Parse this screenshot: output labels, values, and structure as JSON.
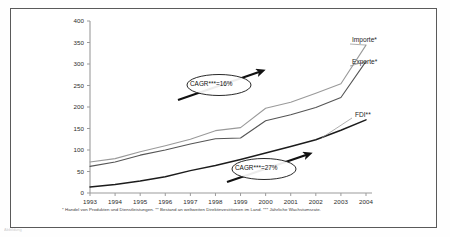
{
  "figure": {
    "frame_border_color": "#5a5a5a",
    "background": "#ffffff",
    "bottom_artifact_text": "Abbildung"
  },
  "footnote": "* Handel von Produkten und Dienstleistungen. ** Bestand an weltweiten Direktinvestitionen im Land. *** Jährliche Wachstumsrate.",
  "annotations": [
    {
      "id": "cagr-trade",
      "label": "CAGR***=16%"
    },
    {
      "id": "cagr-fdi",
      "label": "CAGR***=27%"
    }
  ],
  "series_labels": {
    "importe": "Importe*",
    "exporte": "Exporte*",
    "fdi": "FDI**"
  },
  "chart_data": {
    "type": "line",
    "title": "",
    "xlabel": "",
    "ylabel": "",
    "xlim": [
      1993,
      2004
    ],
    "ylim": [
      0,
      400
    ],
    "grid": false,
    "legend": "inline-right",
    "x": [
      1993,
      1994,
      1995,
      1996,
      1997,
      1998,
      1999,
      2000,
      2001,
      2002,
      2003,
      2004
    ],
    "xticks": [
      "1993",
      "1994",
      "1995",
      "1996",
      "1997",
      "1998",
      "1999",
      "2000",
      "2001",
      "2002",
      "2003",
      "2004"
    ],
    "yticks": [
      0,
      50,
      100,
      150,
      200,
      250,
      300,
      350,
      400
    ],
    "ytick_labels": [
      "0",
      "50",
      "100",
      "150",
      "200",
      "250",
      "300",
      "350",
      "400"
    ],
    "series": [
      {
        "name": "Importe*",
        "color": "#9a9a9a",
        "values": [
          72,
          80,
          96,
          110,
          125,
          145,
          152,
          197,
          211,
          232,
          254,
          344
        ]
      },
      {
        "name": "Exporte*",
        "color": "#555555",
        "values": [
          62,
          72,
          88,
          100,
          114,
          126,
          128,
          168,
          182,
          199,
          222,
          306
        ]
      },
      {
        "name": "FDI**",
        "color": "#1c1c1c",
        "values": [
          14,
          20,
          28,
          38,
          52,
          64,
          78,
          93,
          108,
          124,
          146,
          170
        ]
      }
    ]
  }
}
